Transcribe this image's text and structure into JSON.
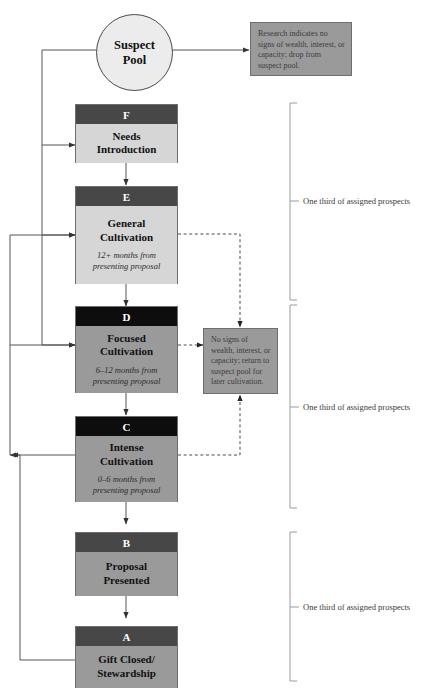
{
  "diagram": {
    "title_cut": "",
    "suspect_pool": {
      "label": "Suspect\nPool",
      "line1": "Suspect",
      "line2": "Pool"
    },
    "notes": [
      {
        "id": "note-drop",
        "text": "Research indicates no signs of wealth, interest, or capacity; drop from suspect pool."
      },
      {
        "id": "note-return",
        "text": "No signs of wealth, interest, or capacity; return to suspect pool for later cultivation."
      }
    ],
    "stages": [
      {
        "letter": "F",
        "line1": "Needs",
        "line2": "Introduction",
        "sub": "",
        "header_color": "#474747",
        "body_color": "#d6d6d6"
      },
      {
        "letter": "E",
        "line1": "General",
        "line2": "Cultivation",
        "sub_line1": "12+ months from",
        "sub_line2": "presenting proposal",
        "header_color": "#474747",
        "body_color": "#d6d6d6"
      },
      {
        "letter": "D",
        "line1": "Focused",
        "line2": "Cultivation",
        "sub_line1": "6–12 months from",
        "sub_line2": "presenting proposal",
        "header_color": "#0d0d0d",
        "body_color": "#9a9a9a"
      },
      {
        "letter": "C",
        "line1": "Intense",
        "line2": "Cultivation",
        "sub_line1": "0–6 months from",
        "sub_line2": "presenting proposal",
        "header_color": "#0d0d0d",
        "body_color": "#9a9a9a"
      },
      {
        "letter": "B",
        "line1": "Proposal",
        "line2": "Presented",
        "sub": "",
        "header_color": "#474747",
        "body_color": "#9a9a9a"
      },
      {
        "letter": "A",
        "line1": "Gift Closed/",
        "line2": "Stewardship",
        "sub": "",
        "header_color": "#474747",
        "body_color": "#9a9a9a"
      }
    ],
    "brackets": [
      {
        "label": "One third of assigned prospects"
      },
      {
        "label": "One third of assigned prospects"
      },
      {
        "label": "One third of assigned prospects"
      }
    ],
    "colors": {
      "header_dark": "#474747",
      "header_black": "#0d0d0d",
      "body_light": "#d6d6d6",
      "body_mid": "#9a9a9a",
      "note_fill": "#9a9a9a",
      "circle_fill": "#ececec",
      "line": "#555555",
      "page_bg": "#ffffff"
    }
  }
}
